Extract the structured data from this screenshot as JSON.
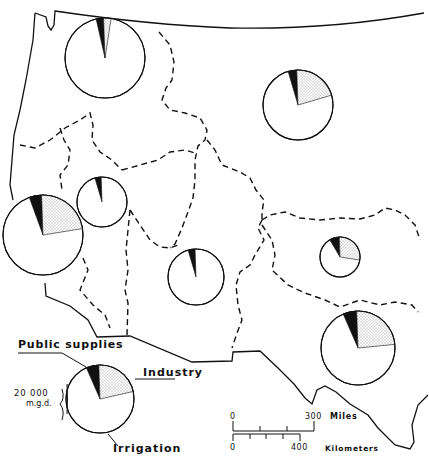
{
  "map": {
    "title": "Water withdrawals by region",
    "colors": {
      "ink": "#111111",
      "background": "#ffffff",
      "public_supplies": "#111111",
      "industry": "stipple",
      "irrigation": "#ffffff"
    }
  },
  "legend": {
    "public_supplies_label": "Public supplies",
    "industry_label": "Industry",
    "irrigation_label": "Irrigation",
    "size_value": "20 000",
    "size_unit": "m.g.d."
  },
  "scale": {
    "miles_zero": "0",
    "miles_max": "300",
    "miles_label": "Miles",
    "km_zero": "0",
    "km_max": "400",
    "km_label": "Kilometers"
  },
  "chart_data": {
    "type": "pie",
    "legend": [
      "Public supplies",
      "Industry",
      "Irrigation"
    ],
    "reference_size": {
      "value": 20000,
      "unit": "m.g.d."
    },
    "pies": [
      {
        "region": "Pacific Northwest",
        "cx": 105,
        "cy": 58,
        "r": 40,
        "public_supplies_pct": 3,
        "industry_pct": 3,
        "irrigation_pct": 94
      },
      {
        "region": "Missouri Basin",
        "cx": 298,
        "cy": 105,
        "r": 35,
        "public_supplies_pct": 4,
        "industry_pct": 21,
        "irrigation_pct": 75
      },
      {
        "region": "Great Basin",
        "cx": 102,
        "cy": 202,
        "r": 25,
        "public_supplies_pct": 4,
        "industry_pct": 0,
        "irrigation_pct": 96
      },
      {
        "region": "California",
        "cx": 43,
        "cy": 235,
        "r": 40,
        "public_supplies_pct": 5,
        "industry_pct": 23,
        "irrigation_pct": 72
      },
      {
        "region": "Colorado Basin",
        "cx": 196,
        "cy": 277,
        "r": 28,
        "public_supplies_pct": 4,
        "industry_pct": 0,
        "irrigation_pct": 96
      },
      {
        "region": "Arkansas-Red Basin",
        "cx": 340,
        "cy": 257,
        "r": 20,
        "public_supplies_pct": 8,
        "industry_pct": 28,
        "irrigation_pct": 64
      },
      {
        "region": "Western Gulf",
        "cx": 358,
        "cy": 348,
        "r": 37,
        "public_supplies_pct": 6,
        "industry_pct": 24,
        "irrigation_pct": 70
      },
      {
        "region": "Legend example",
        "cx": 100,
        "cy": 399,
        "r": 34,
        "public_supplies_pct": 6,
        "industry_pct": 22,
        "irrigation_pct": 72
      }
    ]
  }
}
